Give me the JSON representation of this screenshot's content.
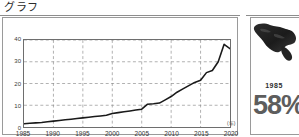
{
  "graph_panel": {
    "caption": "グラフ",
    "axis_unit_label": "(年)"
  },
  "source_panel": {
    "caption": "資料2",
    "map_icon_name": "island-silhouette-icon",
    "year": "1985",
    "percent": "58%"
  },
  "chart_data": {
    "type": "line",
    "title": "グラフ",
    "xlabel": "(年)",
    "ylabel": "",
    "xlim": [
      1985,
      2020
    ],
    "ylim": [
      0,
      40
    ],
    "grid": true,
    "legend": "none",
    "yticks": [
      "0",
      "10",
      "20",
      "30",
      "40"
    ],
    "xticks": [
      "1985",
      "1990",
      "1995",
      "2000",
      "2005",
      "2010",
      "2015",
      "2020"
    ],
    "x": [
      1985,
      1986,
      1987,
      1988,
      1989,
      1990,
      1991,
      1992,
      1993,
      1994,
      1995,
      1996,
      1997,
      1998,
      1999,
      2000,
      2001,
      2002,
      2003,
      2004,
      2005,
      2006,
      2007,
      2008,
      2009,
      2010,
      2011,
      2012,
      2013,
      2014,
      2015,
      2016,
      2017,
      2018,
      2019,
      2020
    ],
    "values": [
      1.5,
      1.7,
      1.9,
      2.1,
      2.4,
      2.7,
      3.0,
      3.3,
      3.6,
      3.9,
      4.2,
      4.5,
      4.8,
      5.1,
      5.4,
      6.2,
      6.6,
      7.0,
      7.4,
      7.8,
      8.2,
      10.5,
      10.7,
      11.0,
      12.5,
      14.0,
      16.0,
      17.5,
      19.0,
      20.5,
      21.5,
      25.0,
      26.0,
      30.0,
      38.0,
      36.0
    ],
    "series": [
      {
        "name": "series-1",
        "values": [
          1.5,
          1.7,
          1.9,
          2.1,
          2.4,
          2.7,
          3.0,
          3.3,
          3.6,
          3.9,
          4.2,
          4.5,
          4.8,
          5.1,
          5.4,
          6.2,
          6.6,
          7.0,
          7.4,
          7.8,
          8.2,
          10.5,
          10.7,
          11.0,
          12.5,
          14.0,
          16.0,
          17.5,
          19.0,
          20.5,
          21.5,
          25.0,
          26.0,
          30.0,
          38.0,
          36.0
        ]
      }
    ]
  }
}
